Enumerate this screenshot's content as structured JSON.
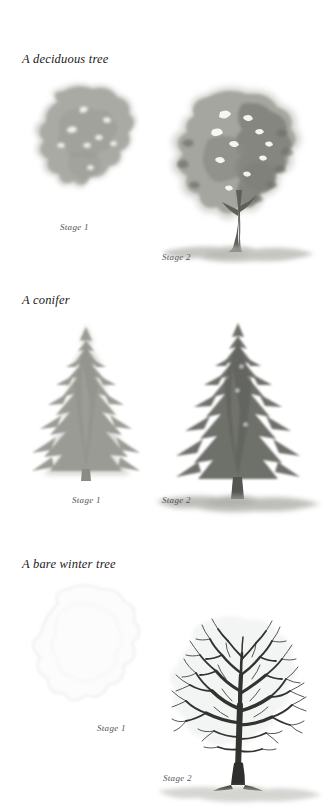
{
  "page": {
    "background": "#ffffff",
    "ink": "#1a1a1a",
    "label_color": "#555555"
  },
  "sections": [
    {
      "id": "deciduous",
      "title": "A deciduous tree",
      "stages": [
        {
          "label": "Stage 1",
          "tone": "#a9aaa4"
        },
        {
          "label": "Stage 2",
          "tone": "#8e8f88"
        }
      ]
    },
    {
      "id": "conifer",
      "title": "A conifer",
      "stages": [
        {
          "label": "Stage 1",
          "tone": "#9a9b94"
        },
        {
          "label": "Stage 2",
          "tone": "#6e6f6a"
        }
      ]
    },
    {
      "id": "bare-winter",
      "title": "A bare winter tree",
      "stages": [
        {
          "label": "Stage 1",
          "tone": "#eef0ee"
        },
        {
          "label": "Stage 2",
          "tone": "#3a3a38"
        }
      ]
    }
  ],
  "palette": {
    "wash_light": "#b9bab4",
    "wash_mid": "#9a9b94",
    "wash_dark": "#76776f",
    "branch_ink": "#2e2e2c",
    "ground": "#b4b5af",
    "pale_outline": "#e3e6e4"
  }
}
